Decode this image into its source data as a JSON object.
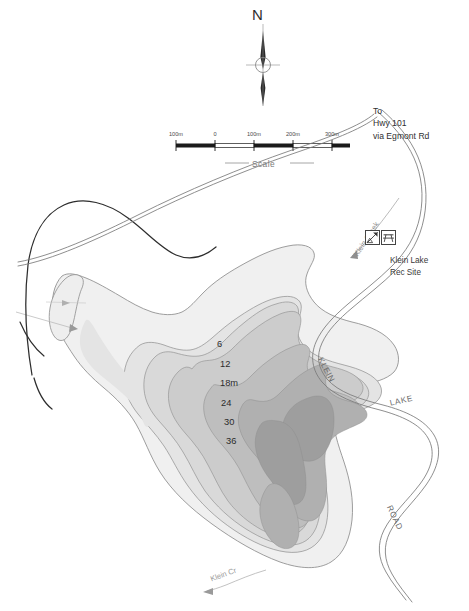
{
  "map": {
    "title": "Klein Lake",
    "subject": "bathymetric depth contour map",
    "background_color": "#ffffff"
  },
  "compass": {
    "label": "N",
    "icon": "north-arrow-icon"
  },
  "scale_bar": {
    "caption": "Scale",
    "tick_labels": [
      "100m",
      "0",
      "100m",
      "200m",
      "300m"
    ],
    "unit": "m"
  },
  "highway_note": {
    "line1": "To",
    "line2": "Hwy 101",
    "line3": "via Egmont Rd"
  },
  "rec_site": {
    "line1": "Klein Lake",
    "line2": "Rec Site",
    "icons": [
      "boat-launch-camping-icon",
      "picnic-table-icon"
    ]
  },
  "water_features": {
    "inlet_creek": "Klein Creek",
    "outlet_creek": "Klein Cr"
  },
  "road_name": {
    "word1": "KLEIN",
    "word2": "LAKE",
    "word3": "ROAD"
  },
  "depth_contours": {
    "unit_label": "18m",
    "labels": [
      "6",
      "12",
      "18m",
      "24",
      "30",
      "36"
    ],
    "values": [
      6,
      12,
      18,
      24,
      30,
      36
    ],
    "fill_colors": [
      "#f0f0f0",
      "#e4e4e4",
      "#d7d7d7",
      "#c8c8c8",
      "#b8b8b8",
      "#a8a8a8",
      "#9a9a9a"
    ],
    "outline_color": "#8d8d8d"
  },
  "colors": {
    "road_line": "#7a7a7a",
    "trail_line": "#2d2d2d",
    "creek_line": "#a9a9a9",
    "text": "#3a3a3a",
    "scale_black": "#1a1a1a"
  }
}
